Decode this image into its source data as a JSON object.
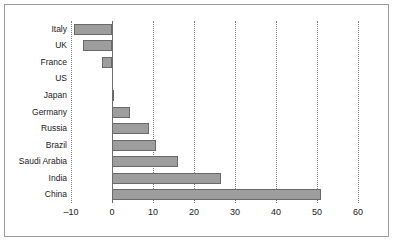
{
  "chart_data": {
    "type": "bar",
    "orientation": "horizontal",
    "title": "",
    "subtitle": "",
    "xlabel": "",
    "ylabel": "",
    "categories": [
      "Italy",
      "UK",
      "France",
      "US",
      "Japan",
      "Germany",
      "Russia",
      "Brazil",
      "Saudi Arabia",
      "India",
      "China"
    ],
    "values": [
      -9.3,
      -7,
      -2.5,
      0,
      0.3,
      4.3,
      9,
      10.7,
      16,
      26.5,
      51
    ],
    "xticks": [
      -10,
      0,
      10,
      20,
      30,
      40,
      50,
      60
    ],
    "xtick_labels": [
      "–10",
      "0",
      "10",
      "20",
      "30",
      "40",
      "50",
      "60"
    ],
    "xlim": [
      -10,
      60
    ],
    "grid": "vertical-dotted",
    "legend": "none",
    "bar_color": "#9d9d9d",
    "bar_edge_color": "#6a6a6a",
    "gridline_color": "#7d7d7d",
    "axis_color": "#6e6e6e",
    "frame_color": "#9b9b9b",
    "background_color": "#ffffff"
  }
}
